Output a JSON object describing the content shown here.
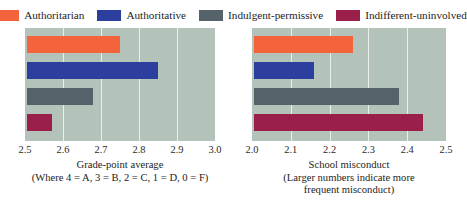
{
  "legend": {
    "items": [
      {
        "label": "Authoritarian",
        "color": "#f4643c",
        "swatch_name": "legend-swatch-authoritarian"
      },
      {
        "label": "Authoritative",
        "color": "#2d3f9e",
        "swatch_name": "legend-swatch-authoritative"
      },
      {
        "label": "Indulgent-permissive",
        "color": "#56626a",
        "swatch_name": "legend-swatch-indulgent-permissive"
      },
      {
        "label": "Indifferent-uninvolved",
        "color": "#9b1f4b",
        "swatch_name": "legend-swatch-indifferent-uninvolved"
      }
    ]
  },
  "colors": {
    "plot_background": "#b3c3b9",
    "gridline": "#e9efe9",
    "page_background": "#ffffff"
  },
  "chart_data": [
    {
      "type": "bar",
      "orientation": "horizontal",
      "panel": "left",
      "title": "",
      "xlabel": "Grade-point average",
      "xlabel_note": "(Where 4 = A, 3 = B, 2 = C, 1 = D, 0 = F)",
      "ylabel": "",
      "xlim": [
        2.5,
        3.0
      ],
      "xticks": [
        "2.5",
        "2.6",
        "2.7",
        "2.8",
        "2.9",
        "3.0"
      ],
      "xtick_values": [
        2.5,
        2.6,
        2.7,
        2.8,
        2.9,
        3.0
      ],
      "grid": true,
      "legend_position": "top",
      "categories": [
        "Authoritarian",
        "Authoritative",
        "Indulgent-permissive",
        "Indifferent-uninvolved"
      ],
      "values": [
        2.75,
        2.85,
        2.68,
        2.57
      ],
      "colors": [
        "#f4643c",
        "#2d3f9e",
        "#56626a",
        "#9b1f4b"
      ]
    },
    {
      "type": "bar",
      "orientation": "horizontal",
      "panel": "right",
      "title": "",
      "xlabel": "School misconduct",
      "xlabel_note": "(Larger numbers indicate more",
      "xlabel_note2": "frequent misconduct)",
      "ylabel": "",
      "xlim": [
        2.0,
        2.5
      ],
      "xticks": [
        "2.0",
        "2.1",
        "2.2",
        "2.3",
        "2.4",
        "2.5"
      ],
      "xtick_values": [
        2.0,
        2.1,
        2.2,
        2.3,
        2.4,
        2.5
      ],
      "grid": true,
      "legend_position": "top",
      "categories": [
        "Authoritarian",
        "Authoritative",
        "Indulgent-permissive",
        "Indifferent-uninvolved"
      ],
      "values": [
        2.26,
        2.16,
        2.38,
        2.44
      ],
      "colors": [
        "#f4643c",
        "#2d3f9e",
        "#56626a",
        "#9b1f4b"
      ]
    }
  ]
}
